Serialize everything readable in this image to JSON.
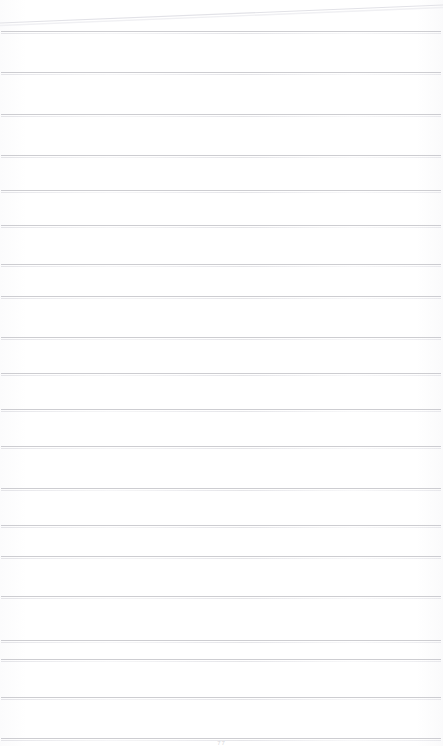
{
  "document": {
    "kind": "scanned-lined-notebook-page",
    "title": "",
    "body_text": "",
    "width_px": 443,
    "height_px": 746
  },
  "colors": {
    "background": "#fdfdfd",
    "paper": "#ffffff",
    "rule_line": "#c9c9ce",
    "sheet_edge": "#e2e2e7",
    "page_number_text": "#b6b6bb"
  },
  "sheet_edge": {
    "name": "top-sheet-edge",
    "left_y": 23,
    "right_y": 5,
    "stroke_width": 1
  },
  "ruling": {
    "count": 17,
    "spacing_px": 41.3,
    "first_line_y": 31,
    "inset_left_px": 1,
    "inset_right_px": 2,
    "lines": [
      {
        "index": 1,
        "y": 31,
        "left": 1,
        "right": 441
      },
      {
        "index": 2,
        "y": 72,
        "left": 1,
        "right": 441
      },
      {
        "index": 3,
        "y": 114,
        "left": 1,
        "right": 441
      },
      {
        "index": 4,
        "y": 155,
        "left": 1,
        "right": 441
      },
      {
        "index": 5,
        "y": 190,
        "left": 1,
        "right": 441
      },
      {
        "index": 6,
        "y": 225,
        "left": 1,
        "right": 441
      },
      {
        "index": 7,
        "y": 264,
        "left": 1,
        "right": 441
      },
      {
        "index": 8,
        "y": 296,
        "left": 1,
        "right": 441
      },
      {
        "index": 9,
        "y": 337,
        "left": 1,
        "right": 441
      },
      {
        "index": 10,
        "y": 373,
        "left": 1,
        "right": 441
      },
      {
        "index": 11,
        "y": 409,
        "left": 1,
        "right": 441
      },
      {
        "index": 12,
        "y": 446,
        "left": 1,
        "right": 441
      },
      {
        "index": 13,
        "y": 488,
        "left": 1,
        "right": 441
      },
      {
        "index": 14,
        "y": 525,
        "left": 1,
        "right": 441
      },
      {
        "index": 15,
        "y": 556,
        "left": 1,
        "right": 441
      },
      {
        "index": 16,
        "y": 596,
        "left": 1,
        "right": 441
      },
      {
        "index": 17,
        "y": 640,
        "left": 1,
        "right": 441
      },
      {
        "index": 18,
        "y": 659,
        "left": 1,
        "right": 441
      },
      {
        "index": 19,
        "y": 697,
        "left": 1,
        "right": 441
      },
      {
        "index": 20,
        "y": 738,
        "left": 1,
        "right": 441
      }
    ]
  },
  "page_number": {
    "name": "page-number",
    "text": "77",
    "y": 738,
    "visible": true
  }
}
